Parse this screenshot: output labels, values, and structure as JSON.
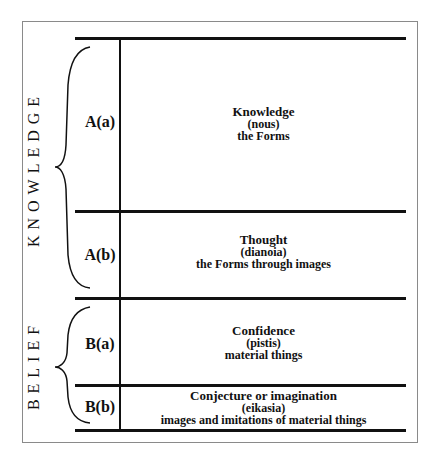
{
  "groups": [
    {
      "label": "KNOWLEDGE"
    },
    {
      "label": "BELIEF"
    }
  ],
  "segments": [
    {
      "code": "A(a)",
      "title": "Knowledge",
      "greek": "(nous)",
      "object": "the Forms"
    },
    {
      "code": "A(b)",
      "title": "Thought",
      "greek": "(dianoia)",
      "object": "the Forms through images"
    },
    {
      "code": "B(a)",
      "title": "Confidence",
      "greek": "(pistis)",
      "object": "material things"
    },
    {
      "code": "B(b)",
      "title": "Conjecture or imagination",
      "greek": "(eikasia)",
      "object": "images and imitations of material things"
    }
  ],
  "colors": {
    "line": "#111111",
    "frame": "#8a8a8a",
    "background": "#ffffff"
  }
}
